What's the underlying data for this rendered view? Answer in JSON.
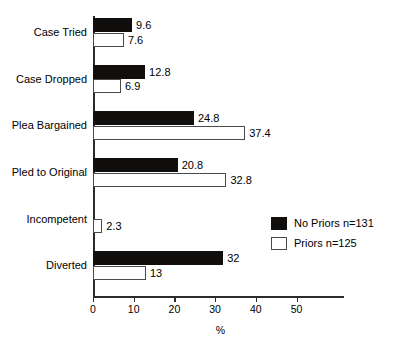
{
  "chart_data": {
    "type": "bar",
    "orientation": "horizontal",
    "title": "",
    "xlabel": "%",
    "ylabel": "",
    "xlim": [
      0,
      61.7
    ],
    "xticks": [
      0,
      10,
      20,
      30,
      40,
      50
    ],
    "xtick_labels": [
      "0",
      "10",
      "20",
      "30",
      "40",
      "50"
    ],
    "grid": false,
    "legend_position": "center-right",
    "categories": [
      "Case Tried",
      "Case Dropped",
      "Plea Bargained",
      "Pled to Original",
      "Incompetent",
      "Diverted"
    ],
    "series": [
      {
        "name": "No Priors n=131",
        "color": "#100f0d",
        "fill": "solid-black",
        "values": [
          9.6,
          12.8,
          24.8,
          20.8,
          null,
          32
        ],
        "value_labels": [
          "9.6",
          "12.8",
          "24.8",
          "20.8",
          "",
          "32"
        ]
      },
      {
        "name": "Priors n=125",
        "color": "#ffffff",
        "fill": "white-outline",
        "values": [
          7.6,
          6.9,
          37.4,
          32.8,
          2.3,
          13
        ],
        "value_labels": [
          "7.6",
          "6.9",
          "37.4",
          "32.8",
          "2.3",
          "13"
        ]
      }
    ]
  },
  "legend": {
    "items": [
      {
        "label": "No Priors n=131",
        "style": "dark"
      },
      {
        "label": "Priors n=125",
        "style": "light"
      }
    ]
  },
  "axis": {
    "x_title": "%",
    "ticks": [
      "0",
      "10",
      "20",
      "30",
      "40",
      "50"
    ]
  },
  "categories": {
    "0": "Case Tried",
    "1": "Case Dropped",
    "2": "Plea Bargained",
    "3": "Pled to Original",
    "4": "Incompetent",
    "5": "Diverted"
  },
  "colors": {
    "dark_series": "#100f0d",
    "light_series": "#ffffff",
    "outline": "#4a4a4a",
    "axis": "#2b2b2b",
    "background": "#ffffff"
  }
}
